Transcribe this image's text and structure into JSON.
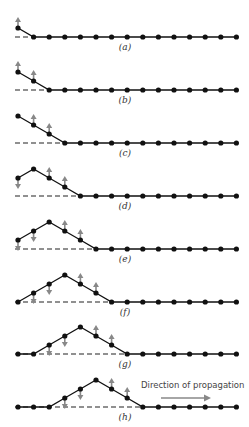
{
  "figure": {
    "width": 249,
    "height": 427,
    "dot_count": 15,
    "dot_x0": 18,
    "dot_spacing": 15.6,
    "step_height": 9,
    "row_baselines": [
      37,
      90,
      143,
      196,
      249,
      302,
      354,
      407
    ],
    "label_offset_y": 11,
    "colors": {
      "line": "#111111",
      "dot": "#111111",
      "dash": "#222222",
      "arrow": "#888888",
      "text": "#333333"
    },
    "rows": [
      {
        "label": "(a)",
        "heights": [
          1,
          0,
          0,
          0,
          0,
          0,
          0,
          0,
          0,
          0,
          0,
          0,
          0,
          0,
          0
        ],
        "dash_until": 1,
        "arrows_up": [
          0
        ],
        "arrows_down": []
      },
      {
        "label": "(b)",
        "heights": [
          2,
          1,
          0,
          0,
          0,
          0,
          0,
          0,
          0,
          0,
          0,
          0,
          0,
          0,
          0
        ],
        "dash_until": 2,
        "arrows_up": [
          0,
          1
        ],
        "arrows_down": []
      },
      {
        "label": "(c)",
        "heights": [
          3,
          2,
          1,
          0,
          0,
          0,
          0,
          0,
          0,
          0,
          0,
          0,
          0,
          0,
          0
        ],
        "dash_until": 3,
        "arrows_up": [
          1,
          2
        ],
        "arrows_down": []
      },
      {
        "label": "(d)",
        "heights": [
          2,
          3,
          2,
          1,
          0,
          0,
          0,
          0,
          0,
          0,
          0,
          0,
          0,
          0,
          0
        ],
        "dash_until": 4,
        "arrows_up": [
          2,
          3
        ],
        "arrows_down": [
          0
        ]
      },
      {
        "label": "(e)",
        "heights": [
          1,
          2,
          3,
          2,
          1,
          0,
          0,
          0,
          0,
          0,
          0,
          0,
          0,
          0,
          0
        ],
        "dash_until": 5,
        "arrows_up": [
          3,
          4
        ],
        "arrows_down": [
          0,
          1
        ]
      },
      {
        "label": "(f)",
        "heights": [
          0,
          1,
          2,
          3,
          2,
          1,
          0,
          0,
          0,
          0,
          0,
          0,
          0,
          0,
          0
        ],
        "dash_until": 6,
        "arrows_up": [
          4,
          5
        ],
        "arrows_down": [
          1,
          2
        ]
      },
      {
        "label": "(g)",
        "heights": [
          0,
          0,
          1,
          2,
          3,
          2,
          1,
          0,
          0,
          0,
          0,
          0,
          0,
          0,
          0
        ],
        "dash_until": 7,
        "arrows_up": [
          5,
          6
        ],
        "arrows_down": [
          2,
          3
        ]
      },
      {
        "label": "(h)",
        "heights": [
          0,
          0,
          0,
          1,
          2,
          3,
          2,
          1,
          0,
          0,
          0,
          0,
          0,
          0,
          0
        ],
        "dash_until": 8,
        "arrows_up": [
          6,
          7
        ],
        "arrows_down": [
          3,
          4
        ]
      }
    ],
    "propagation": {
      "text": "Direction of propagation",
      "text_x": 141,
      "text_y": 380,
      "arrow_x1": 161,
      "arrow_x2": 211,
      "arrow_y": 398
    }
  }
}
